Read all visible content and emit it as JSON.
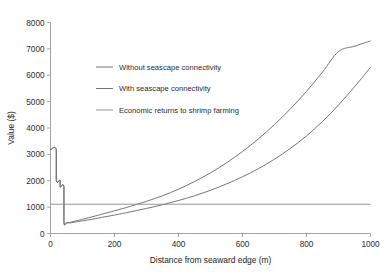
{
  "chart_data": {
    "type": "line",
    "title": "",
    "xlabel": "Distance from seaward edge (m)",
    "ylabel": "Value ($)",
    "xlim": [
      0,
      1000
    ],
    "ylim": [
      0,
      8000
    ],
    "xticks": [
      "0",
      "200",
      "400",
      "600",
      "800",
      "1000"
    ],
    "xtick_values": [
      0,
      200,
      400,
      600,
      800,
      1000
    ],
    "yticks": [
      "0",
      "1000",
      "2000",
      "3000",
      "4000",
      "5000",
      "6000",
      "7000",
      "8000"
    ],
    "ytick_values": [
      0,
      1000,
      2000,
      3000,
      4000,
      5000,
      6000,
      7000,
      8000
    ],
    "grid": false,
    "legend_position": "upper-center-left",
    "series": [
      {
        "name": "Without seascape connectivity",
        "color": "#6e6e6e",
        "x": [
          0,
          18,
          18,
          30,
          30,
          42,
          42,
          50,
          55,
          60,
          70,
          90,
          120,
          160,
          200,
          250,
          300,
          350,
          400,
          450,
          500,
          550,
          600,
          650,
          700,
          750,
          800,
          850,
          900,
          950,
          1000
        ],
        "y": [
          3180,
          3180,
          2020,
          2020,
          1760,
          1760,
          420,
          400,
          398,
          400,
          420,
          460,
          520,
          610,
          700,
          820,
          950,
          1090,
          1250,
          1430,
          1640,
          1880,
          2150,
          2460,
          2820,
          3230,
          3700,
          4250,
          4870,
          5560,
          6300
        ]
      },
      {
        "name": "With seascape connectivity",
        "color": "#6e6e6e",
        "x": [
          0,
          18,
          18,
          30,
          30,
          42,
          42,
          50,
          55,
          60,
          70,
          90,
          120,
          160,
          200,
          250,
          300,
          350,
          400,
          450,
          500,
          550,
          600,
          650,
          700,
          750,
          800,
          850,
          900,
          950,
          1000
        ],
        "y": [
          3180,
          3180,
          2020,
          2020,
          1760,
          1760,
          440,
          420,
          415,
          420,
          450,
          510,
          600,
          730,
          860,
          1030,
          1220,
          1430,
          1680,
          1970,
          2300,
          2680,
          3110,
          3590,
          4130,
          4730,
          5390,
          6120,
          6900,
          7100,
          7300
        ]
      },
      {
        "name": "Economic returns to shrimp farming",
        "color": "#8f8f8f",
        "x": [
          0,
          1000
        ],
        "y": [
          1110,
          1110
        ]
      }
    ],
    "legend": [
      {
        "label": "Without seascape connectivity",
        "color": "#6e6e6e"
      },
      {
        "label": "With seascape connectivity",
        "color": "#6e6e6e"
      },
      {
        "label": "Economic returns to shrimp farming",
        "color": "#8f8f8f"
      }
    ]
  }
}
